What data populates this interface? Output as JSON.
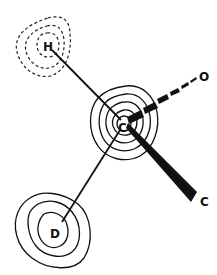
{
  "diagram": {
    "type": "electron-density-contour-map",
    "atoms": [
      {
        "id": "H",
        "label": "H",
        "contour_style": "dashed",
        "contour_count": 3
      },
      {
        "id": "C_center",
        "label": "C",
        "contour_style": "solid",
        "contour_count": 5
      },
      {
        "id": "O",
        "label": "O",
        "contour_style": "none",
        "contour_count": 0
      },
      {
        "id": "C_lower",
        "label": "C",
        "contour_style": "none",
        "contour_count": 0
      },
      {
        "id": "D",
        "label": "D",
        "contour_style": "solid",
        "contour_count": 3
      }
    ],
    "bonds": [
      {
        "from": "C_center",
        "to": "H",
        "style": "plain"
      },
      {
        "from": "C_center",
        "to": "O",
        "style": "hashed-wedge"
      },
      {
        "from": "C_center",
        "to": "C_lower",
        "style": "solid-wedge"
      },
      {
        "from": "C_center",
        "to": "D",
        "style": "plain"
      }
    ],
    "colors": {
      "ink": "#111111",
      "background": "#ffffff"
    }
  }
}
